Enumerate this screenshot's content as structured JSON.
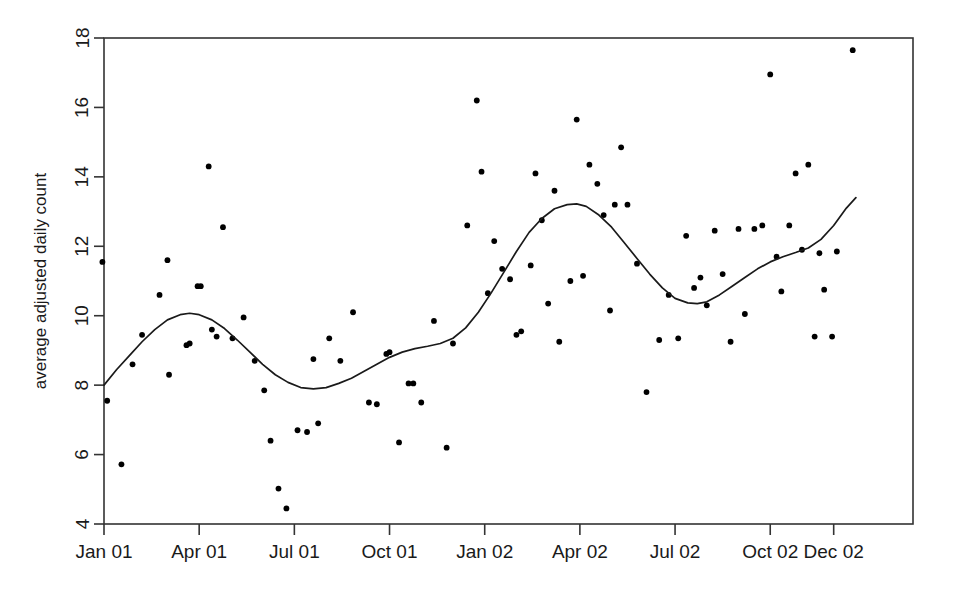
{
  "chart_data": {
    "type": "scatter",
    "title": "",
    "subtitle": "",
    "xlabel": "",
    "ylabel": "average adjusted daily count",
    "xlim": [
      0,
      25.5
    ],
    "ylim": [
      4,
      18
    ],
    "grid": false,
    "legend": null,
    "x_tick_labels": [
      "Jan 01",
      "Apr 01",
      "Jul 01",
      "Oct 01",
      "Jan 02",
      "Apr 02",
      "Jul 02",
      "Oct 02",
      "Dec 02"
    ],
    "x_tick_values": [
      0,
      3,
      6,
      9,
      12,
      15,
      18,
      21,
      23
    ],
    "y_tick_labels": [
      "4",
      "6",
      "8",
      "10",
      "12",
      "14",
      "16",
      "18"
    ],
    "y_tick_values": [
      4,
      6,
      8,
      10,
      12,
      14,
      16,
      18
    ],
    "point_color": "#000000",
    "line_color": "#1a1a1a",
    "axis_color": "#333333",
    "series": [
      {
        "name": "observations",
        "type": "scatter",
        "points": [
          [
            -0.05,
            11.55
          ],
          [
            0.1,
            7.55
          ],
          [
            0.55,
            5.72
          ],
          [
            0.9,
            8.6
          ],
          [
            1.2,
            9.45
          ],
          [
            1.75,
            10.6
          ],
          [
            2.0,
            11.6
          ],
          [
            2.05,
            8.3
          ],
          [
            2.6,
            9.15
          ],
          [
            2.7,
            9.2
          ],
          [
            2.95,
            10.85
          ],
          [
            3.05,
            10.85
          ],
          [
            3.3,
            14.3
          ],
          [
            3.4,
            9.6
          ],
          [
            3.55,
            9.4
          ],
          [
            3.75,
            12.55
          ],
          [
            4.05,
            9.35
          ],
          [
            4.4,
            9.95
          ],
          [
            4.75,
            8.7
          ],
          [
            5.05,
            7.85
          ],
          [
            5.25,
            6.4
          ],
          [
            5.5,
            5.02
          ],
          [
            5.75,
            4.45
          ],
          [
            6.1,
            6.7
          ],
          [
            6.4,
            6.65
          ],
          [
            6.6,
            8.75
          ],
          [
            6.75,
            6.9
          ],
          [
            7.1,
            9.35
          ],
          [
            7.45,
            8.7
          ],
          [
            7.85,
            10.1
          ],
          [
            8.35,
            7.5
          ],
          [
            8.6,
            7.45
          ],
          [
            8.9,
            8.9
          ],
          [
            9.0,
            8.95
          ],
          [
            9.3,
            6.35
          ],
          [
            9.6,
            8.05
          ],
          [
            9.75,
            8.05
          ],
          [
            10.0,
            7.5
          ],
          [
            10.4,
            9.85
          ],
          [
            10.8,
            6.2
          ],
          [
            11.0,
            9.2
          ],
          [
            11.45,
            12.6
          ],
          [
            11.75,
            16.2
          ],
          [
            11.9,
            14.15
          ],
          [
            12.1,
            10.65
          ],
          [
            12.3,
            12.15
          ],
          [
            12.55,
            11.35
          ],
          [
            12.8,
            11.05
          ],
          [
            13.0,
            9.45
          ],
          [
            13.15,
            9.55
          ],
          [
            13.45,
            11.45
          ],
          [
            13.6,
            14.1
          ],
          [
            13.8,
            12.75
          ],
          [
            14.0,
            10.35
          ],
          [
            14.2,
            13.6
          ],
          [
            14.35,
            9.25
          ],
          [
            14.7,
            11.0
          ],
          [
            14.9,
            15.65
          ],
          [
            15.1,
            11.15
          ],
          [
            15.3,
            14.35
          ],
          [
            15.55,
            13.8
          ],
          [
            15.75,
            12.9
          ],
          [
            15.95,
            10.15
          ],
          [
            16.1,
            13.2
          ],
          [
            16.3,
            14.85
          ],
          [
            16.5,
            13.2
          ],
          [
            16.8,
            11.5
          ],
          [
            17.1,
            7.8
          ],
          [
            17.5,
            9.3
          ],
          [
            17.8,
            10.6
          ],
          [
            18.1,
            9.35
          ],
          [
            18.35,
            12.3
          ],
          [
            18.6,
            10.8
          ],
          [
            18.8,
            11.1
          ],
          [
            19.0,
            10.3
          ],
          [
            19.25,
            12.45
          ],
          [
            19.5,
            11.2
          ],
          [
            19.75,
            9.25
          ],
          [
            20.0,
            12.5
          ],
          [
            20.2,
            10.05
          ],
          [
            20.5,
            12.5
          ],
          [
            20.75,
            12.6
          ],
          [
            21.0,
            16.95
          ],
          [
            21.2,
            11.7
          ],
          [
            21.35,
            10.7
          ],
          [
            21.6,
            12.6
          ],
          [
            21.8,
            14.1
          ],
          [
            22.0,
            11.9
          ],
          [
            22.2,
            14.35
          ],
          [
            22.4,
            9.4
          ],
          [
            22.55,
            11.8
          ],
          [
            22.7,
            10.75
          ],
          [
            22.95,
            9.4
          ],
          [
            23.1,
            11.85
          ],
          [
            23.6,
            17.65
          ]
        ]
      },
      {
        "name": "smoothed-trend",
        "type": "line",
        "points": [
          [
            0.0,
            8.0
          ],
          [
            0.4,
            8.45
          ],
          [
            0.8,
            8.85
          ],
          [
            1.2,
            9.25
          ],
          [
            1.6,
            9.6
          ],
          [
            2.0,
            9.88
          ],
          [
            2.4,
            10.03
          ],
          [
            2.7,
            10.07
          ],
          [
            3.0,
            10.03
          ],
          [
            3.4,
            9.88
          ],
          [
            3.8,
            9.63
          ],
          [
            4.2,
            9.3
          ],
          [
            4.6,
            8.95
          ],
          [
            5.0,
            8.6
          ],
          [
            5.4,
            8.3
          ],
          [
            5.8,
            8.08
          ],
          [
            6.2,
            7.93
          ],
          [
            6.6,
            7.89
          ],
          [
            7.0,
            7.93
          ],
          [
            7.4,
            8.05
          ],
          [
            7.8,
            8.2
          ],
          [
            8.2,
            8.4
          ],
          [
            8.6,
            8.6
          ],
          [
            9.0,
            8.8
          ],
          [
            9.4,
            8.95
          ],
          [
            9.8,
            9.05
          ],
          [
            10.2,
            9.12
          ],
          [
            10.6,
            9.2
          ],
          [
            11.0,
            9.35
          ],
          [
            11.4,
            9.65
          ],
          [
            11.8,
            10.1
          ],
          [
            12.2,
            10.65
          ],
          [
            12.6,
            11.25
          ],
          [
            13.0,
            11.85
          ],
          [
            13.4,
            12.4
          ],
          [
            13.8,
            12.8
          ],
          [
            14.2,
            13.08
          ],
          [
            14.6,
            13.2
          ],
          [
            14.9,
            13.22
          ],
          [
            15.2,
            13.15
          ],
          [
            15.6,
            12.9
          ],
          [
            16.0,
            12.55
          ],
          [
            16.4,
            12.1
          ],
          [
            16.8,
            11.65
          ],
          [
            17.2,
            11.2
          ],
          [
            17.6,
            10.8
          ],
          [
            18.0,
            10.5
          ],
          [
            18.4,
            10.37
          ],
          [
            18.7,
            10.35
          ],
          [
            19.0,
            10.4
          ],
          [
            19.4,
            10.6
          ],
          [
            19.8,
            10.85
          ],
          [
            20.2,
            11.1
          ],
          [
            20.6,
            11.35
          ],
          [
            21.0,
            11.55
          ],
          [
            21.4,
            11.7
          ],
          [
            21.8,
            11.82
          ],
          [
            22.2,
            11.95
          ],
          [
            22.6,
            12.2
          ],
          [
            23.0,
            12.6
          ],
          [
            23.4,
            13.1
          ],
          [
            23.7,
            13.4
          ]
        ]
      }
    ]
  }
}
